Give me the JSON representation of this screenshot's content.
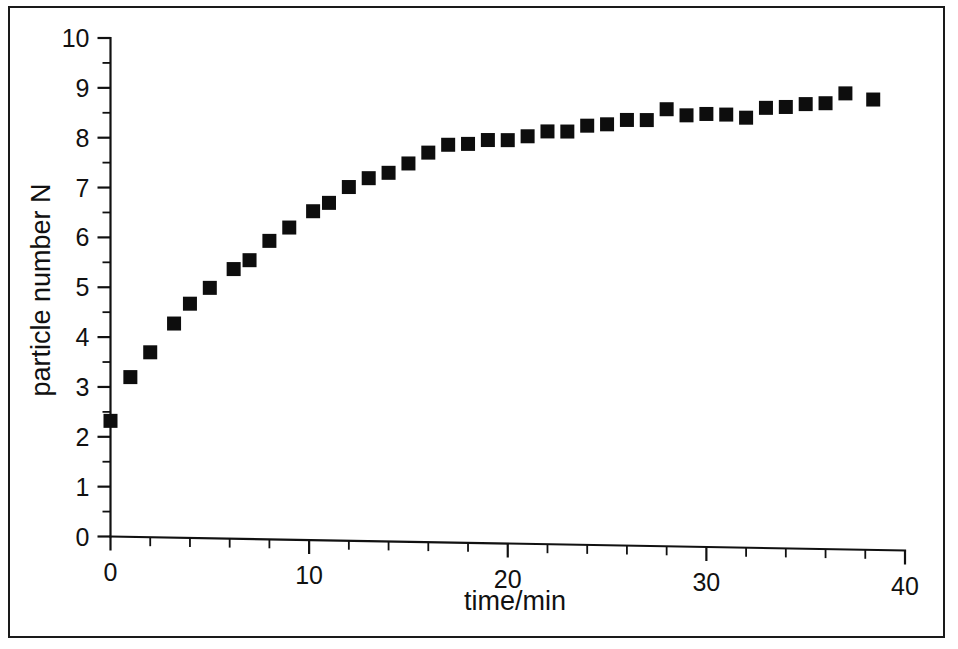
{
  "figure": {
    "background_color": "#ffffff",
    "frame_color": "#1a1a1a",
    "marker_color": "#0d0d0d",
    "axis_color": "#111111"
  },
  "chart_data": {
    "type": "scatter",
    "title": "",
    "xlabel": "time/min",
    "ylabel": "particle number N",
    "xlim": [
      0,
      40
    ],
    "ylim": [
      0,
      10
    ],
    "x_major_ticks": [
      0,
      10,
      20,
      30,
      40
    ],
    "x_minor_tick_step": 2,
    "y_major_ticks": [
      0,
      1,
      2,
      3,
      4,
      5,
      6,
      7,
      8,
      9,
      10
    ],
    "y_minor_tick_step": 0.5,
    "x_ticklabels": [
      "0",
      "10",
      "20",
      "30",
      "40"
    ],
    "y_ticklabels": [
      "0",
      "1",
      "2",
      "3",
      "4",
      "5",
      "6",
      "7",
      "8",
      "9",
      "10"
    ],
    "grid": false,
    "legend": null,
    "marker_shape": "square",
    "marker_size_px": 14,
    "series": [
      {
        "name": "particle number N",
        "x": [
          0,
          1,
          2,
          3.2,
          4,
          5,
          6.2,
          7,
          8,
          9,
          10.2,
          11,
          12,
          13,
          14,
          15,
          16,
          17,
          18,
          19,
          20,
          21,
          22,
          23,
          24,
          25,
          26,
          27,
          28,
          29,
          30,
          31,
          32,
          33,
          34,
          35,
          36,
          37,
          38.4
        ],
        "y": [
          2.32,
          3.2,
          3.7,
          4.28,
          4.68,
          5.0,
          5.38,
          5.56,
          5.95,
          6.22,
          6.55,
          6.72,
          7.04,
          7.22,
          7.33,
          7.52,
          7.74,
          7.9,
          7.92,
          8.0,
          8.0,
          8.08,
          8.18,
          8.18,
          8.3,
          8.33,
          8.42,
          8.42,
          8.64,
          8.52,
          8.55,
          8.54,
          8.48,
          8.68,
          8.7,
          8.76,
          8.78,
          8.98,
          8.86
        ]
      }
    ]
  },
  "axes": {
    "x_axis_label": "time/min",
    "y_axis_label": "particle number N"
  }
}
